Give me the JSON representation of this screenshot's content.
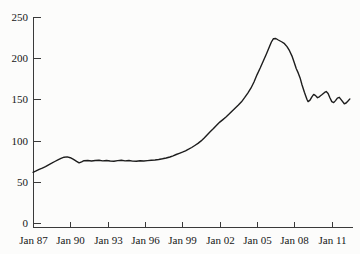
{
  "colors": {
    "background": "#fcfcfb",
    "axis": "#3a3a3a",
    "text": "#161616",
    "line": "#1d1d1d"
  },
  "chart_data": {
    "type": "line",
    "title": "",
    "xlabel": "",
    "ylabel": "",
    "grid": false,
    "legend": "none",
    "ylim": [
      0,
      250
    ],
    "xlim": [
      1987.0,
      2012.7
    ],
    "y_ticks": [
      0,
      50,
      100,
      150,
      200,
      250
    ],
    "x_tick_years": [
      1987,
      1990,
      1993,
      1996,
      1999,
      2002,
      2005,
      2008,
      2011
    ],
    "x_tick_labels": [
      "Jan 87",
      "Jan 90",
      "Jan 93",
      "Jan 96",
      "Jan 99",
      "Jan 02",
      "Jan 05",
      "Jan 08",
      "Jan 11"
    ],
    "series": [
      {
        "name": "price-index",
        "color": "#1d1d1d",
        "points": [
          [
            1987.0,
            61.5
          ],
          [
            1987.25,
            63.2
          ],
          [
            1987.5,
            65.0
          ],
          [
            1987.75,
            66.6
          ],
          [
            1988.0,
            68.5
          ],
          [
            1988.25,
            70.6
          ],
          [
            1988.5,
            72.6
          ],
          [
            1988.75,
            74.6
          ],
          [
            1989.0,
            76.6
          ],
          [
            1989.25,
            78.4
          ],
          [
            1989.5,
            79.8
          ],
          [
            1989.75,
            80.2
          ],
          [
            1990.0,
            79.2
          ],
          [
            1990.25,
            77.2
          ],
          [
            1990.5,
            74.8
          ],
          [
            1990.7,
            72.9
          ],
          [
            1990.9,
            74.2
          ],
          [
            1991.1,
            75.6
          ],
          [
            1991.4,
            75.9
          ],
          [
            1991.7,
            75.2
          ],
          [
            1992.0,
            75.9
          ],
          [
            1992.3,
            76.2
          ],
          [
            1992.6,
            75.4
          ],
          [
            1992.9,
            75.9
          ],
          [
            1993.2,
            75.3
          ],
          [
            1993.5,
            74.9
          ],
          [
            1993.8,
            75.7
          ],
          [
            1994.1,
            76.1
          ],
          [
            1994.4,
            75.4
          ],
          [
            1994.7,
            75.9
          ],
          [
            1995.0,
            75.1
          ],
          [
            1995.3,
            74.9
          ],
          [
            1995.6,
            75.6
          ],
          [
            1995.9,
            75.3
          ],
          [
            1996.2,
            75.7
          ],
          [
            1996.5,
            76.1
          ],
          [
            1996.8,
            76.5
          ],
          [
            1997.1,
            77.1
          ],
          [
            1997.4,
            77.9
          ],
          [
            1997.7,
            78.9
          ],
          [
            1998.0,
            80.1
          ],
          [
            1998.25,
            81.6
          ],
          [
            1998.5,
            83.1
          ],
          [
            1998.75,
            84.6
          ],
          [
            1999.0,
            86.1
          ],
          [
            1999.25,
            87.6
          ],
          [
            1999.5,
            89.6
          ],
          [
            1999.75,
            91.6
          ],
          [
            2000.0,
            94.1
          ],
          [
            2000.25,
            96.6
          ],
          [
            2000.5,
            99.6
          ],
          [
            2000.75,
            103.1
          ],
          [
            2001.0,
            107.1
          ],
          [
            2001.25,
            111.1
          ],
          [
            2001.5,
            114.6
          ],
          [
            2001.75,
            118.6
          ],
          [
            2002.0,
            122.5
          ],
          [
            2002.25,
            125.5
          ],
          [
            2002.5,
            128.6
          ],
          [
            2002.75,
            132.1
          ],
          [
            2003.0,
            136.1
          ],
          [
            2003.25,
            139.6
          ],
          [
            2003.5,
            143.1
          ],
          [
            2003.75,
            147.1
          ],
          [
            2004.0,
            152.1
          ],
          [
            2004.25,
            157.6
          ],
          [
            2004.5,
            163.6
          ],
          [
            2004.75,
            171.1
          ],
          [
            2005.0,
            180.1
          ],
          [
            2005.25,
            188.1
          ],
          [
            2005.5,
            196.6
          ],
          [
            2005.75,
            205.1
          ],
          [
            2006.0,
            214.1
          ],
          [
            2006.15,
            219.6
          ],
          [
            2006.3,
            223.6
          ],
          [
            2006.5,
            223.9
          ],
          [
            2006.7,
            222.1
          ],
          [
            2007.0,
            219.6
          ],
          [
            2007.2,
            217.6
          ],
          [
            2007.4,
            214.1
          ],
          [
            2007.6,
            209.1
          ],
          [
            2007.8,
            202.6
          ],
          [
            2008.0,
            194.1
          ],
          [
            2008.15,
            187.1
          ],
          [
            2008.3,
            182.1
          ],
          [
            2008.45,
            176.1
          ],
          [
            2008.6,
            168.1
          ],
          [
            2008.8,
            158.6
          ],
          [
            2009.0,
            150.1
          ],
          [
            2009.1,
            147.3
          ],
          [
            2009.25,
            149.1
          ],
          [
            2009.4,
            153.1
          ],
          [
            2009.55,
            156.1
          ],
          [
            2009.7,
            154.6
          ],
          [
            2009.85,
            152.1
          ],
          [
            2010.0,
            153.1
          ],
          [
            2010.2,
            155.6
          ],
          [
            2010.4,
            158.1
          ],
          [
            2010.55,
            159.6
          ],
          [
            2010.7,
            157.1
          ],
          [
            2010.85,
            152.1
          ],
          [
            2011.0,
            147.3
          ],
          [
            2011.15,
            146.1
          ],
          [
            2011.3,
            148.6
          ],
          [
            2011.45,
            151.6
          ],
          [
            2011.6,
            152.6
          ],
          [
            2011.75,
            149.6
          ],
          [
            2012.0,
            144.6
          ],
          [
            2012.15,
            145.6
          ],
          [
            2012.3,
            148.1
          ],
          [
            2012.45,
            150.6
          ]
        ]
      }
    ]
  }
}
